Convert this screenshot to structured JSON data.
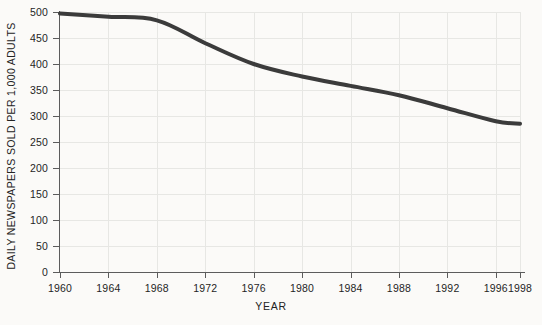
{
  "chart_data": {
    "type": "line",
    "title": "",
    "xlabel": "YEAR",
    "ylabel": "DAILY NEWSPAPERS SOLD PER 1,000 ADULTS",
    "xlim": [
      1960,
      1998
    ],
    "ylim": [
      0,
      500
    ],
    "grid": true,
    "legend": "none",
    "xticks": [
      1960,
      1964,
      1968,
      1972,
      1976,
      1980,
      1984,
      1988,
      1992,
      1996,
      1998
    ],
    "xtick_labels": [
      "1960",
      "1964",
      "1968",
      "1972",
      "1976",
      "1980",
      "1984",
      "1988",
      "1992",
      "1996",
      "1998"
    ],
    "yticks": [
      0,
      50,
      100,
      150,
      200,
      250,
      300,
      350,
      400,
      450,
      500
    ],
    "ytick_labels": [
      "0",
      "50",
      "100",
      "150",
      "200",
      "250",
      "300",
      "350",
      "400",
      "450",
      "500"
    ],
    "series": [
      {
        "name": "Daily newspapers sold per 1,000 adults",
        "color": "#3b3b3b",
        "line_width": 4,
        "x": [
          1960,
          1964,
          1968,
          1972,
          1976,
          1980,
          1984,
          1988,
          1992,
          1996,
          1998
        ],
        "values": [
          497,
          491,
          484,
          440,
          400,
          376,
          358,
          340,
          315,
          290,
          285
        ]
      }
    ],
    "background_color": "#fbfaf8",
    "grid_color": "#e7e7e4",
    "axis_color": "#5c5c5c"
  }
}
